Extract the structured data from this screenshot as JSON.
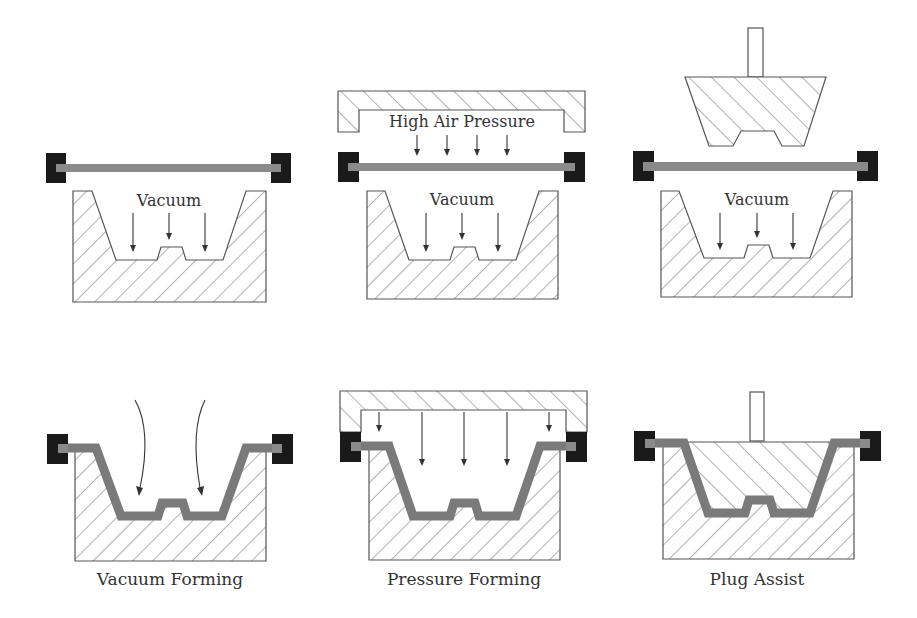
{
  "figure": {
    "colors": {
      "clamp": "#1a1a1a",
      "sheet": "#8a8a8a",
      "formed_sheet": "#7a7a7a",
      "outline": "#555555",
      "hatch": "#666666",
      "text": "#333333"
    },
    "panels": [
      {
        "id": "vacuum-before",
        "row": 1,
        "col": 1,
        "labels": [
          "Vacuum"
        ],
        "arrows": 3
      },
      {
        "id": "pressure-before",
        "row": 1,
        "col": 2,
        "labels": [
          "High Air Pressure",
          "Vacuum"
        ],
        "arrows_pressure": 4,
        "arrows_vacuum": 3
      },
      {
        "id": "plug-before",
        "row": 1,
        "col": 3,
        "labels": [
          "Vacuum"
        ],
        "arrows": 3
      },
      {
        "id": "vacuum-after",
        "row": 2,
        "col": 1,
        "caption": "Vacuum Forming",
        "arrows_curved": 2
      },
      {
        "id": "pressure-after",
        "row": 2,
        "col": 2,
        "caption": "Pressure Forming",
        "arrows": 5
      },
      {
        "id": "plug-after",
        "row": 2,
        "col": 3,
        "caption": "Plug Assist"
      }
    ],
    "text": {
      "vacuum": "Vacuum",
      "high_air_pressure": "High Air Pressure",
      "caption_vacuum_forming": "Vacuum Forming",
      "caption_pressure_forming": "Pressure Forming",
      "caption_plug_assist": "Plug Assist"
    }
  }
}
